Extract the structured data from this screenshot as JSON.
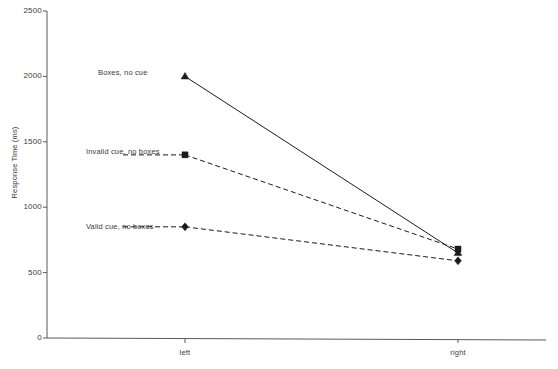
{
  "chart_data": {
    "type": "line",
    "title": "",
    "xlabel": "",
    "ylabel": "Response Time (ms)",
    "categories": [
      "left",
      "right"
    ],
    "x_tick_labels": [
      "left",
      "right"
    ],
    "y_tick_labels": [
      "0",
      "500",
      "1000",
      "1500",
      "2000",
      "2500"
    ],
    "y_ticks": [
      0,
      500,
      1000,
      1500,
      2000,
      2500
    ],
    "ylim": [
      0,
      2500
    ],
    "grid": false,
    "legend_position": "inline-left-of-points",
    "series": [
      {
        "name": "Boxes, no cue",
        "values": [
          2000,
          650
        ],
        "marker": "triangle",
        "line_style": "solid",
        "color": "#1a1a1a"
      },
      {
        "name": "Invalid cue, no boxes",
        "values": [
          1400,
          680
        ],
        "marker": "square",
        "line_style": "dashed",
        "color": "#1a1a1a"
      },
      {
        "name": "Valid cue, no boxes",
        "values": [
          850,
          590
        ],
        "marker": "diamond",
        "line_style": "dashed",
        "color": "#1a1a1a"
      }
    ]
  },
  "axis": {
    "y_title": "Response Time (ms)",
    "y_labels": {
      "t0": "0",
      "t500": "500",
      "t1000": "1000",
      "t1500": "1500",
      "t2000": "2000",
      "t2500": "2500"
    },
    "x_labels": {
      "left": "left",
      "right": "right"
    }
  },
  "series_labels": {
    "boxes_no_cue": "Boxes, no cue",
    "invalid_cue_no_boxes": "Invalid cue, no boxes",
    "valid_cue_no_boxes": "Valid cue, no boxes"
  },
  "colors": {
    "ink": "#1a1a1a",
    "axis": "#555555",
    "text": "#3a3a3a",
    "background": "#ffffff"
  }
}
